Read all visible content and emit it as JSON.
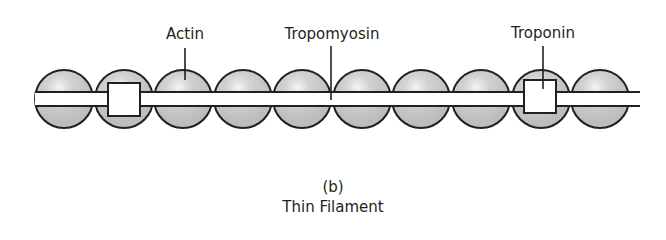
{
  "figure": {
    "panel_label": "(b)",
    "title": "Thin Filament"
  },
  "labels": {
    "actin": "Actin",
    "tropomyosin": "Tropomyosin",
    "troponin": "Troponin"
  },
  "components": {
    "actin_bead_count": 10,
    "troponin_count": 2,
    "tropomyosin_strand_count": 1
  },
  "colors": {
    "bead_fill": "#c8c8c8",
    "bead_highlight": "#f4f4f4",
    "outline": "#231f20",
    "background": "#ffffff"
  }
}
